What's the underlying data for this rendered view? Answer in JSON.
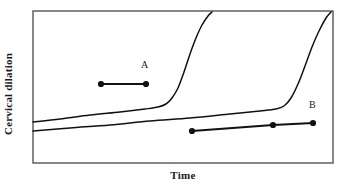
{
  "chart_data": {
    "type": "line",
    "title": "",
    "xlabel": "Time",
    "ylabel": "Cervical dilation",
    "grid": false,
    "legend": null,
    "axes": {
      "x_ticks": [],
      "y_ticks": [],
      "x_range_描述": "unlabeled qualitative time axis",
      "y_range_description": "unlabeled qualitative dilation axis"
    },
    "series": [
      {
        "name": "labor-curve-1",
        "description": "sigmoid labor curve with early acceleration phase",
        "points": [
          [
            33,
            122
          ],
          [
            60,
            119
          ],
          [
            90,
            115
          ],
          [
            120,
            112
          ],
          [
            145,
            109
          ],
          [
            158,
            107
          ],
          [
            166,
            104
          ],
          [
            172,
            98
          ],
          [
            178,
            88
          ],
          [
            184,
            72
          ],
          [
            190,
            54
          ],
          [
            196,
            38
          ],
          [
            202,
            25
          ],
          [
            208,
            16
          ],
          [
            212,
            12
          ]
        ]
      },
      {
        "name": "labor-curve-2",
        "description": "sigmoid labor curve with delayed acceleration phase",
        "points": [
          [
            33,
            131
          ],
          [
            70,
            128
          ],
          [
            110,
            125
          ],
          [
            150,
            121
          ],
          [
            190,
            118
          ],
          [
            230,
            114
          ],
          [
            260,
            111
          ],
          [
            276,
            109
          ],
          [
            284,
            106
          ],
          [
            291,
            98
          ],
          [
            298,
            84
          ],
          [
            305,
            66
          ],
          [
            312,
            47
          ],
          [
            319,
            31
          ],
          [
            326,
            18
          ],
          [
            331,
            12
          ]
        ]
      }
    ],
    "annotations": [
      {
        "name": "segment-a",
        "label": "A",
        "label_position": [
          141,
          60
        ],
        "dots": [
          [
            101,
            84
          ],
          [
            146,
            84
          ]
        ]
      },
      {
        "name": "segment-b",
        "label": "B",
        "label_position": [
          309,
          100
        ],
        "dots": [
          [
            192,
            131
          ],
          [
            273,
            125
          ],
          [
            313,
            123
          ]
        ]
      }
    ],
    "colors": {
      "curve": "#111111",
      "frame": "#555555",
      "marker": "#111111",
      "text": "#1a1a1a",
      "background": "#ffffff"
    }
  },
  "axes": {
    "ylabel": "Cervical dilation",
    "xlabel": "Time"
  },
  "labels": {
    "a": "A",
    "b": "B"
  }
}
